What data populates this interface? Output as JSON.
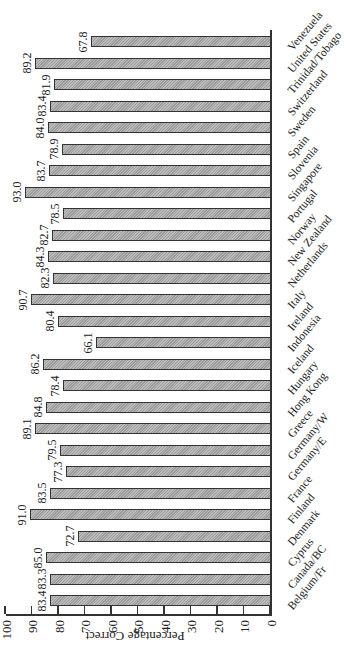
{
  "chart_data": {
    "type": "bar",
    "orientation": "vertical bars, image rotated 90 degrees",
    "title": "",
    "xlabel": "",
    "ylabel": "Percentage Correct",
    "ylim": [
      0,
      100
    ],
    "yticks": [
      "0",
      "10",
      "20",
      "30",
      "40",
      "50",
      "60",
      "70",
      "80",
      "90",
      "100"
    ],
    "grid": false,
    "legend": null,
    "categories": [
      "Belgium/Fr",
      "Canada/BC",
      "Cyprus",
      "Denmark",
      "Finland",
      "France",
      "Germany/E",
      "Germany/W",
      "Greece",
      "Hong Kong",
      "Hungary",
      "Iceland",
      "Indonesia",
      "Ireland",
      "Italy",
      "Netherlands",
      "New Zealand",
      "Norway",
      "Portugal",
      "Singapore",
      "Slovenia",
      "Spain",
      "Sweden",
      "Switzerland",
      "Trinidad/Tobago",
      "United States",
      "Venezuela"
    ],
    "values": [
      83.4,
      83.3,
      85.0,
      72.7,
      91.0,
      83.5,
      77.3,
      79.5,
      89.1,
      84.8,
      78.4,
      86.2,
      66.1,
      80.4,
      90.7,
      82.3,
      84.3,
      82.7,
      78.5,
      93.0,
      83.7,
      78.9,
      84.0,
      83.4,
      81.9,
      89.2,
      67.8
    ],
    "value_labels": [
      "83.4",
      "83.3",
      "85.0",
      "72.7",
      "91.0",
      "83.5",
      "77.3",
      "79.5",
      "89.1",
      "84.8",
      "78.4",
      "86.2",
      "66.1",
      "80.4",
      "90.7",
      "82.3",
      "84.3",
      "82.7",
      "78.5",
      "93.0",
      "83.7",
      "78.9",
      "84.0",
      "83.4",
      "81.9",
      "89.2",
      "67.8"
    ]
  },
  "colors": {
    "bar_fill": "#9a9a9a",
    "bar_border": "#333333",
    "axis": "#333333",
    "background": "#ffffff"
  }
}
